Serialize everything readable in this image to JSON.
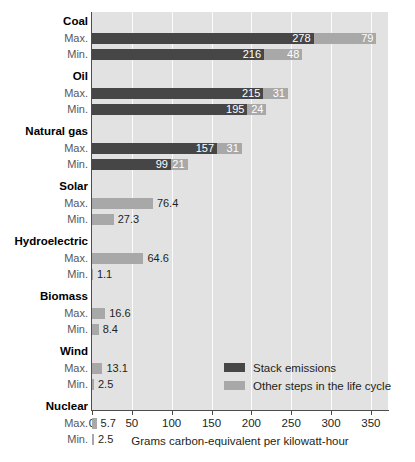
{
  "chart_data": {
    "type": "bar",
    "orientation": "horizontal",
    "stacked": true,
    "title": "",
    "xlabel": "Grams carbon-equivalent per kilowatt-hour",
    "ylabel": "",
    "xlim": [
      0,
      380
    ],
    "xticks": [
      0,
      50,
      100,
      150,
      200,
      250,
      300,
      350
    ],
    "xticklabels": [
      "0",
      "50",
      "100",
      "150",
      "200",
      "250",
      "300",
      "350"
    ],
    "grid": "vertical",
    "legend": {
      "position": "inside-lower-right",
      "entries": [
        {
          "name": "Stack emissions",
          "color": "#464646"
        },
        {
          "name": "Other steps in the life cycle",
          "color": "#a8a8a8"
        }
      ]
    },
    "series": [
      {
        "name": "Stack emissions",
        "color": "#464646"
      },
      {
        "name": "Other steps in the life cycle",
        "color": "#a8a8a8"
      }
    ],
    "groups": [
      {
        "category": "Coal",
        "rows": [
          {
            "label": "Max.",
            "stack": 278,
            "other": 79,
            "stack_text": "278",
            "other_text": "79",
            "total": 357
          },
          {
            "label": "Min.",
            "stack": 216,
            "other": 48,
            "stack_text": "216",
            "other_text": "48",
            "total": 264
          }
        ]
      },
      {
        "category": "Oil",
        "rows": [
          {
            "label": "Max.",
            "stack": 215,
            "other": 31,
            "stack_text": "215",
            "other_text": "31",
            "total": 246
          },
          {
            "label": "Min.",
            "stack": 195,
            "other": 24,
            "stack_text": "195",
            "other_text": "24",
            "total": 219
          }
        ]
      },
      {
        "category": "Natural gas",
        "rows": [
          {
            "label": "Max.",
            "stack": 157,
            "other": 31,
            "stack_text": "157",
            "other_text": "31",
            "total": 188
          },
          {
            "label": "Min.",
            "stack": 99,
            "other": 21,
            "stack_text": "99",
            "other_text": "21",
            "total": 120
          }
        ]
      },
      {
        "category": "Solar",
        "rows": [
          {
            "label": "Max.",
            "stack": 0,
            "other": 76.4,
            "stack_text": "",
            "other_text": "76.4",
            "total": 76.4
          },
          {
            "label": "Min.",
            "stack": 0,
            "other": 27.3,
            "stack_text": "",
            "other_text": "27.3",
            "total": 27.3
          }
        ]
      },
      {
        "category": "Hydroelectric",
        "rows": [
          {
            "label": "Max.",
            "stack": 0,
            "other": 64.6,
            "stack_text": "",
            "other_text": "64.6",
            "total": 64.6
          },
          {
            "label": "Min.",
            "stack": 0,
            "other": 1.1,
            "stack_text": "",
            "other_text": "1.1",
            "total": 1.1
          }
        ]
      },
      {
        "category": "Biomass",
        "rows": [
          {
            "label": "Max.",
            "stack": 0,
            "other": 16.6,
            "stack_text": "",
            "other_text": "16.6",
            "total": 16.6
          },
          {
            "label": "Min.",
            "stack": 0,
            "other": 8.4,
            "stack_text": "",
            "other_text": "8.4",
            "total": 8.4
          }
        ]
      },
      {
        "category": "Wind",
        "rows": [
          {
            "label": "Max.",
            "stack": 0,
            "other": 13.1,
            "stack_text": "",
            "other_text": "13.1",
            "total": 13.1
          },
          {
            "label": "Min.",
            "stack": 0,
            "other": 2.5,
            "stack_text": "",
            "other_text": "2.5",
            "total": 2.5
          }
        ]
      },
      {
        "category": "Nuclear",
        "rows": [
          {
            "label": "Max.",
            "stack": 0,
            "other": 5.7,
            "stack_text": "",
            "other_text": "5.7",
            "total": 5.7
          },
          {
            "label": "Min.",
            "stack": 0,
            "other": 2.5,
            "stack_text": "",
            "other_text": "2.5",
            "total": 2.5
          }
        ]
      }
    ],
    "colors": {
      "stack_emissions": "#464646",
      "other_steps": "#a8a8a8",
      "plot_background": "#e2e2e2",
      "gridline": "#fbfbfb",
      "axis": "#4d4d4d",
      "text": "#231f20"
    }
  }
}
